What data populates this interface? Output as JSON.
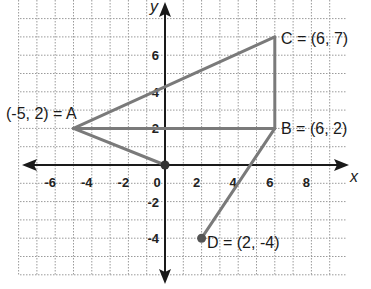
{
  "figure": {
    "type": "coordinate-plane",
    "axes": {
      "x_label": "x",
      "y_label": "y",
      "x_ticks": [
        "-6",
        "-4",
        "-2",
        "0",
        "2",
        "4",
        "6",
        "8"
      ],
      "y_ticks_positive": [
        "2",
        "4",
        "6"
      ],
      "y_ticks_negative": [
        "-2",
        "-4"
      ]
    },
    "points": [
      {
        "name": "A",
        "x": -5,
        "y": 2,
        "label": "(-5, 2) = A"
      },
      {
        "name": "B",
        "x": 6,
        "y": 2,
        "label": "B = (6, 2)"
      },
      {
        "name": "C",
        "x": 6,
        "y": 7,
        "label": "C = (6, 7)"
      },
      {
        "name": "D",
        "x": 2,
        "y": -4,
        "label": "D = (2, -4)"
      },
      {
        "name": "O",
        "x": 0,
        "y": 0,
        "label": "0"
      }
    ],
    "segments": [
      [
        "A",
        "C"
      ],
      [
        "C",
        "B"
      ],
      [
        "A",
        "B"
      ],
      [
        "A",
        "O"
      ],
      [
        "B",
        "D"
      ]
    ],
    "colors": {
      "grid": "#9a9a9a",
      "axis": "#1a1a1a",
      "segment": "#7a7a7a",
      "point": "#555555"
    }
  }
}
